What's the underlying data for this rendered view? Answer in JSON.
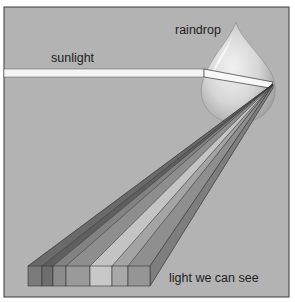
{
  "figure": {
    "type": "diagram",
    "labels": {
      "sunlight": "sunlight",
      "raindrop": "raindrop",
      "visible_light": "light we can see"
    },
    "colors": {
      "background": "#b3b3b3",
      "frame": "#3a3a3a",
      "beam": "#f4f4f4",
      "raindrop_fill": "#d8d8d8"
    },
    "spectrum_bands": [
      {
        "name": "band-1",
        "shade": "#7a7a7a"
      },
      {
        "name": "band-2",
        "shade": "#6e6e6e"
      },
      {
        "name": "band-3",
        "shade": "#8c8c8c"
      },
      {
        "name": "band-4",
        "shade": "#9a9a9a"
      },
      {
        "name": "band-5",
        "shade": "#c8c8c8"
      },
      {
        "name": "band-6",
        "shade": "#a8a8a8"
      },
      {
        "name": "band-7",
        "shade": "#959595"
      }
    ]
  }
}
